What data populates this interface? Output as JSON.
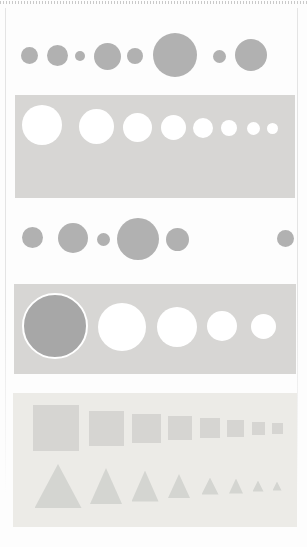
{
  "canvas": {
    "width": 307,
    "height": 547,
    "background": "#fdfdfd"
  },
  "borders": {
    "top_dotted": {
      "color": "#c9c9c9",
      "dash_px": 1,
      "period_px": 3
    },
    "left_line": {
      "x": 5,
      "color": "#e4e4e4"
    },
    "right_line": {
      "x": 297,
      "color": "#e4e4e4"
    }
  },
  "palette": {
    "gray_circle": "#b1b1b1",
    "gray_panel": "#d7d6d4",
    "light_panel": "#ecebe7",
    "white_shape": "#ffffff",
    "dark_circle": "#a7a7a7",
    "dark_circle_ring": "#ffffff",
    "square_gray": "#d6d5d2",
    "triangle_gray": "#d4d5d1"
  },
  "figure": {
    "circle_row_1": {
      "fill": "#b1b1b1",
      "circles": [
        {
          "cx": 29,
          "cy": 55,
          "d": 17
        },
        {
          "cx": 57,
          "cy": 55,
          "d": 21
        },
        {
          "cx": 80,
          "cy": 56,
          "d": 10
        },
        {
          "cx": 107,
          "cy": 56,
          "d": 27
        },
        {
          "cx": 135,
          "cy": 56,
          "d": 16
        },
        {
          "cx": 175,
          "cy": 55,
          "d": 44
        },
        {
          "cx": 219,
          "cy": 56,
          "d": 13
        },
        {
          "cx": 251,
          "cy": 55,
          "d": 32
        }
      ]
    },
    "gray_panel_1": {
      "x": 15,
      "y": 95,
      "w": 280,
      "h": 103,
      "fill": "#d7d6d4",
      "circles": [
        {
          "cx": 42,
          "cy": 125,
          "d": 40,
          "fill": "#ffffff"
        },
        {
          "cx": 96,
          "cy": 126,
          "d": 35,
          "fill": "#ffffff"
        },
        {
          "cx": 137,
          "cy": 127,
          "d": 29,
          "fill": "#ffffff"
        },
        {
          "cx": 173,
          "cy": 127,
          "d": 25,
          "fill": "#ffffff"
        },
        {
          "cx": 203,
          "cy": 128,
          "d": 20,
          "fill": "#ffffff"
        },
        {
          "cx": 229,
          "cy": 128,
          "d": 16,
          "fill": "#ffffff"
        },
        {
          "cx": 253,
          "cy": 128,
          "d": 13,
          "fill": "#ffffff"
        },
        {
          "cx": 272,
          "cy": 128,
          "d": 11,
          "fill": "#ffffff"
        }
      ]
    },
    "circle_row_2": {
      "fill": "#b1b1b1",
      "circles": [
        {
          "cx": 32,
          "cy": 237,
          "d": 21
        },
        {
          "cx": 73,
          "cy": 238,
          "d": 30
        },
        {
          "cx": 103,
          "cy": 239,
          "d": 13
        },
        {
          "cx": 138,
          "cy": 239,
          "d": 42
        },
        {
          "cx": 177,
          "cy": 239,
          "d": 23
        },
        {
          "cx": 285,
          "cy": 238,
          "d": 17
        }
      ]
    },
    "gray_panel_2": {
      "x": 14,
      "y": 284,
      "w": 282,
      "h": 90,
      "fill": "#d7d6d4",
      "circles": [
        {
          "cx": 55,
          "cy": 326,
          "d": 62,
          "fill": "#a7a7a7",
          "ring": "#ffffff",
          "ring_w": 2
        },
        {
          "cx": 122,
          "cy": 327,
          "d": 48,
          "fill": "#ffffff"
        },
        {
          "cx": 177,
          "cy": 327,
          "d": 40,
          "fill": "#ffffff"
        },
        {
          "cx": 222,
          "cy": 326,
          "d": 30,
          "fill": "#ffffff"
        },
        {
          "cx": 263,
          "cy": 326,
          "d": 25,
          "fill": "#ffffff"
        }
      ]
    },
    "light_panel": {
      "x": 13,
      "y": 393,
      "w": 284,
      "h": 134,
      "fill": "#ecebe7",
      "squares_fill": "#d6d5d2",
      "squares_cy": 428,
      "squares": [
        {
          "cx": 56,
          "s": 46
        },
        {
          "cx": 106,
          "s": 35
        },
        {
          "cx": 146,
          "s": 29
        },
        {
          "cx": 180,
          "s": 24
        },
        {
          "cx": 210,
          "s": 20
        },
        {
          "cx": 235,
          "s": 17
        },
        {
          "cx": 258,
          "s": 13
        },
        {
          "cx": 277,
          "s": 11
        }
      ],
      "triangles_fill": "#d4d5d1",
      "triangles_cy": 486,
      "triangles": [
        {
          "cx": 58,
          "w": 47,
          "h": 44
        },
        {
          "cx": 106,
          "w": 32,
          "h": 36
        },
        {
          "cx": 145,
          "w": 27,
          "h": 31
        },
        {
          "cx": 179,
          "w": 22,
          "h": 24
        },
        {
          "cx": 210,
          "w": 17,
          "h": 17
        },
        {
          "cx": 236,
          "w": 14,
          "h": 15
        },
        {
          "cx": 258,
          "w": 11,
          "h": 11
        },
        {
          "cx": 277,
          "w": 9,
          "h": 9
        }
      ]
    }
  }
}
